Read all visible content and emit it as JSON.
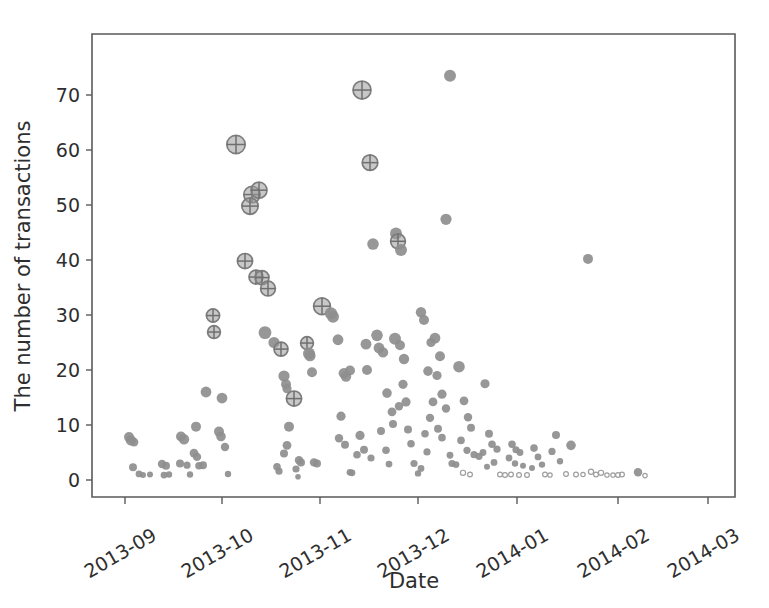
{
  "figure": {
    "background_color": "#ffffff",
    "marker_color": "#8e8e8e",
    "axis_color": "#5a5a5a"
  },
  "chart_data": {
    "type": "scatter",
    "title": "",
    "xlabel": "Date",
    "ylabel": "The number of transactions",
    "grid": false,
    "legend": null,
    "xlim": [
      "2013-08-20",
      "2014-03-05"
    ],
    "ylim": [
      -3,
      76
    ],
    "y_ticks": [
      0,
      10,
      20,
      30,
      40,
      50,
      60,
      70
    ],
    "y_tick_labels": [
      "0",
      "10",
      "20",
      "30",
      "40",
      "50",
      "60",
      "70"
    ],
    "x_ticks": [
      "2013-09",
      "2013-10",
      "2013-11",
      "2013-12",
      "2014-01",
      "2014-02",
      "2014-03"
    ],
    "x_tick_labels": [
      "2013-09",
      "2013-10",
      "2013-11",
      "2013-12",
      "2014-01",
      "2014-02",
      "2014-03"
    ],
    "x_tick_rotation_deg": -30,
    "marker_encoding": {
      "size_meaning": "marker radius scales with magnitude",
      "styles": [
        "solid-disc",
        "ring-with-crosshair",
        "small-hollow-circle"
      ]
    },
    "note": "Each point is one day; y is daily transaction count. Radius r is in plot pixels.",
    "points": [
      {
        "x": 129,
        "y": 7.8,
        "r": 5.0,
        "style": "solid"
      },
      {
        "x": 131,
        "y": 7.2,
        "r": 5.2,
        "style": "solid"
      },
      {
        "x": 134,
        "y": 6.9,
        "r": 4.4,
        "style": "solid"
      },
      {
        "x": 133,
        "y": 2.3,
        "r": 4.0,
        "style": "solid"
      },
      {
        "x": 139,
        "y": 1.1,
        "r": 3.4,
        "style": "solid"
      },
      {
        "x": 143,
        "y": 0.9,
        "r": 3.0,
        "style": "solid"
      },
      {
        "x": 150,
        "y": 1.0,
        "r": 3.0,
        "style": "solid"
      },
      {
        "x": 162,
        "y": 2.9,
        "r": 4.2,
        "style": "solid"
      },
      {
        "x": 166,
        "y": 2.6,
        "r": 4.0,
        "style": "solid"
      },
      {
        "x": 164,
        "y": 0.9,
        "r": 3.4,
        "style": "solid"
      },
      {
        "x": 169,
        "y": 1.0,
        "r": 3.2,
        "style": "solid"
      },
      {
        "x": 181,
        "y": 7.9,
        "r": 5.0,
        "style": "solid"
      },
      {
        "x": 184,
        "y": 7.4,
        "r": 5.2,
        "style": "solid"
      },
      {
        "x": 180,
        "y": 3.0,
        "r": 4.0,
        "style": "solid"
      },
      {
        "x": 187,
        "y": 2.7,
        "r": 3.6,
        "style": "solid"
      },
      {
        "x": 190,
        "y": 1.0,
        "r": 3.2,
        "style": "solid"
      },
      {
        "x": 196,
        "y": 9.7,
        "r": 5.0,
        "style": "solid"
      },
      {
        "x": 194,
        "y": 4.9,
        "r": 4.4,
        "style": "solid"
      },
      {
        "x": 197,
        "y": 4.2,
        "r": 4.2,
        "style": "solid"
      },
      {
        "x": 199,
        "y": 2.6,
        "r": 3.8,
        "style": "solid"
      },
      {
        "x": 203,
        "y": 2.7,
        "r": 4.0,
        "style": "solid"
      },
      {
        "x": 206,
        "y": 16.0,
        "r": 5.4,
        "style": "solid"
      },
      {
        "x": 213,
        "y": 29.9,
        "r": 6.6,
        "style": "ring"
      },
      {
        "x": 214,
        "y": 26.9,
        "r": 6.4,
        "style": "ring"
      },
      {
        "x": 222,
        "y": 14.9,
        "r": 5.4,
        "style": "solid"
      },
      {
        "x": 219,
        "y": 8.8,
        "r": 5.0,
        "style": "solid"
      },
      {
        "x": 221,
        "y": 7.9,
        "r": 4.8,
        "style": "solid"
      },
      {
        "x": 225,
        "y": 6.0,
        "r": 4.2,
        "style": "solid"
      },
      {
        "x": 228,
        "y": 1.1,
        "r": 3.2,
        "style": "solid"
      },
      {
        "x": 236,
        "y": 61.0,
        "r": 9.2,
        "style": "ring"
      },
      {
        "x": 245,
        "y": 39.8,
        "r": 7.6,
        "style": "ring"
      },
      {
        "x": 252,
        "y": 51.9,
        "r": 8.2,
        "style": "ring"
      },
      {
        "x": 250,
        "y": 49.8,
        "r": 8.2,
        "style": "ring"
      },
      {
        "x": 259,
        "y": 52.7,
        "r": 8.0,
        "style": "ring"
      },
      {
        "x": 256,
        "y": 36.9,
        "r": 7.0,
        "style": "ring"
      },
      {
        "x": 262,
        "y": 36.8,
        "r": 7.0,
        "style": "ring"
      },
      {
        "x": 268,
        "y": 34.8,
        "r": 7.4,
        "style": "ring"
      },
      {
        "x": 265,
        "y": 26.8,
        "r": 6.4,
        "style": "solid"
      },
      {
        "x": 274,
        "y": 25.0,
        "r": 5.6,
        "style": "solid"
      },
      {
        "x": 281,
        "y": 23.8,
        "r": 7.0,
        "style": "ring"
      },
      {
        "x": 284,
        "y": 18.9,
        "r": 5.6,
        "style": "solid"
      },
      {
        "x": 286,
        "y": 17.4,
        "r": 5.0,
        "style": "solid"
      },
      {
        "x": 287,
        "y": 16.6,
        "r": 4.6,
        "style": "solid"
      },
      {
        "x": 289,
        "y": 9.7,
        "r": 5.0,
        "style": "solid"
      },
      {
        "x": 287,
        "y": 6.3,
        "r": 4.4,
        "style": "solid"
      },
      {
        "x": 284,
        "y": 4.8,
        "r": 4.0,
        "style": "solid"
      },
      {
        "x": 279,
        "y": 1.6,
        "r": 3.6,
        "style": "solid"
      },
      {
        "x": 277,
        "y": 2.4,
        "r": 3.8,
        "style": "solid"
      },
      {
        "x": 294,
        "y": 14.8,
        "r": 7.6,
        "style": "ring"
      },
      {
        "x": 296,
        "y": 2.0,
        "r": 3.6,
        "style": "solid"
      },
      {
        "x": 299,
        "y": 3.6,
        "r": 4.2,
        "style": "solid"
      },
      {
        "x": 301,
        "y": 3.2,
        "r": 4.0,
        "style": "solid"
      },
      {
        "x": 298,
        "y": 0.6,
        "r": 2.8,
        "style": "solid"
      },
      {
        "x": 307,
        "y": 24.9,
        "r": 6.4,
        "style": "ring"
      },
      {
        "x": 309,
        "y": 23.0,
        "r": 6.0,
        "style": "solid"
      },
      {
        "x": 310,
        "y": 22.6,
        "r": 5.6,
        "style": "solid"
      },
      {
        "x": 312,
        "y": 19.6,
        "r": 5.0,
        "style": "solid"
      },
      {
        "x": 314,
        "y": 3.2,
        "r": 4.2,
        "style": "solid"
      },
      {
        "x": 317,
        "y": 3.0,
        "r": 4.0,
        "style": "solid"
      },
      {
        "x": 322,
        "y": 31.6,
        "r": 8.4,
        "style": "ring"
      },
      {
        "x": 331,
        "y": 30.3,
        "r": 6.2,
        "style": "solid"
      },
      {
        "x": 333,
        "y": 29.7,
        "r": 6.0,
        "style": "solid"
      },
      {
        "x": 338,
        "y": 25.5,
        "r": 5.4,
        "style": "solid"
      },
      {
        "x": 344,
        "y": 19.4,
        "r": 5.4,
        "style": "solid"
      },
      {
        "x": 346,
        "y": 18.8,
        "r": 5.2,
        "style": "solid"
      },
      {
        "x": 350,
        "y": 19.9,
        "r": 5.0,
        "style": "solid"
      },
      {
        "x": 341,
        "y": 11.6,
        "r": 4.6,
        "style": "solid"
      },
      {
        "x": 339,
        "y": 7.6,
        "r": 4.2,
        "style": "solid"
      },
      {
        "x": 345,
        "y": 6.4,
        "r": 4.0,
        "style": "solid"
      },
      {
        "x": 350,
        "y": 1.4,
        "r": 3.4,
        "style": "solid"
      },
      {
        "x": 352,
        "y": 1.3,
        "r": 3.4,
        "style": "solid"
      },
      {
        "x": 362,
        "y": 70.9,
        "r": 9.0,
        "style": "ring"
      },
      {
        "x": 370,
        "y": 57.7,
        "r": 7.8,
        "style": "ring"
      },
      {
        "x": 373,
        "y": 42.9,
        "r": 5.8,
        "style": "solid"
      },
      {
        "x": 377,
        "y": 26.3,
        "r": 5.8,
        "style": "solid"
      },
      {
        "x": 379,
        "y": 24.0,
        "r": 5.4,
        "style": "solid"
      },
      {
        "x": 366,
        "y": 24.7,
        "r": 5.4,
        "style": "solid"
      },
      {
        "x": 367,
        "y": 20.0,
        "r": 5.0,
        "style": "solid"
      },
      {
        "x": 360,
        "y": 8.1,
        "r": 4.6,
        "style": "solid"
      },
      {
        "x": 364,
        "y": 5.5,
        "r": 4.0,
        "style": "solid"
      },
      {
        "x": 357,
        "y": 4.6,
        "r": 3.8,
        "style": "solid"
      },
      {
        "x": 371,
        "y": 4.0,
        "r": 3.6,
        "style": "solid"
      },
      {
        "x": 383,
        "y": 23.2,
        "r": 5.2,
        "style": "solid"
      },
      {
        "x": 387,
        "y": 15.8,
        "r": 4.8,
        "style": "solid"
      },
      {
        "x": 392,
        "y": 12.4,
        "r": 4.4,
        "style": "solid"
      },
      {
        "x": 381,
        "y": 8.9,
        "r": 4.0,
        "style": "solid"
      },
      {
        "x": 386,
        "y": 5.4,
        "r": 3.8,
        "style": "solid"
      },
      {
        "x": 389,
        "y": 2.9,
        "r": 3.4,
        "style": "solid"
      },
      {
        "x": 396,
        "y": 44.8,
        "r": 6.0,
        "style": "solid"
      },
      {
        "x": 398,
        "y": 43.4,
        "r": 7.4,
        "style": "ring"
      },
      {
        "x": 401,
        "y": 41.8,
        "r": 6.0,
        "style": "solid"
      },
      {
        "x": 395,
        "y": 25.7,
        "r": 6.0,
        "style": "solid"
      },
      {
        "x": 400,
        "y": 24.5,
        "r": 5.0,
        "style": "solid"
      },
      {
        "x": 404,
        "y": 22.0,
        "r": 5.2,
        "style": "solid"
      },
      {
        "x": 403,
        "y": 17.4,
        "r": 4.6,
        "style": "solid"
      },
      {
        "x": 406,
        "y": 14.2,
        "r": 4.6,
        "style": "solid"
      },
      {
        "x": 399,
        "y": 13.4,
        "r": 4.2,
        "style": "solid"
      },
      {
        "x": 393,
        "y": 10.2,
        "r": 4.0,
        "style": "solid"
      },
      {
        "x": 408,
        "y": 9.2,
        "r": 4.0,
        "style": "solid"
      },
      {
        "x": 411,
        "y": 6.6,
        "r": 3.8,
        "style": "solid"
      },
      {
        "x": 414,
        "y": 3.0,
        "r": 3.6,
        "style": "solid"
      },
      {
        "x": 418,
        "y": 1.2,
        "r": 3.2,
        "style": "solid"
      },
      {
        "x": 421,
        "y": 30.5,
        "r": 5.2,
        "style": "solid"
      },
      {
        "x": 424,
        "y": 29.1,
        "r": 5.0,
        "style": "solid"
      },
      {
        "x": 450,
        "y": 73.5,
        "r": 6.0,
        "style": "solid"
      },
      {
        "x": 446,
        "y": 47.4,
        "r": 5.6,
        "style": "solid"
      },
      {
        "x": 435,
        "y": 25.8,
        "r": 5.4,
        "style": "solid"
      },
      {
        "x": 431,
        "y": 25.0,
        "r": 4.6,
        "style": "solid"
      },
      {
        "x": 440,
        "y": 22.5,
        "r": 5.0,
        "style": "solid"
      },
      {
        "x": 428,
        "y": 19.8,
        "r": 4.8,
        "style": "solid"
      },
      {
        "x": 437,
        "y": 19.0,
        "r": 4.6,
        "style": "solid"
      },
      {
        "x": 442,
        "y": 15.6,
        "r": 4.6,
        "style": "solid"
      },
      {
        "x": 433,
        "y": 14.2,
        "r": 4.4,
        "style": "solid"
      },
      {
        "x": 446,
        "y": 13.0,
        "r": 4.2,
        "style": "solid"
      },
      {
        "x": 430,
        "y": 11.3,
        "r": 4.2,
        "style": "solid"
      },
      {
        "x": 438,
        "y": 9.3,
        "r": 4.0,
        "style": "solid"
      },
      {
        "x": 425,
        "y": 8.4,
        "r": 3.8,
        "style": "solid"
      },
      {
        "x": 442,
        "y": 7.7,
        "r": 3.8,
        "style": "solid"
      },
      {
        "x": 427,
        "y": 5.1,
        "r": 3.6,
        "style": "solid"
      },
      {
        "x": 450,
        "y": 4.5,
        "r": 3.4,
        "style": "solid"
      },
      {
        "x": 452,
        "y": 3.0,
        "r": 3.6,
        "style": "solid"
      },
      {
        "x": 421,
        "y": 2.1,
        "r": 3.4,
        "style": "solid"
      },
      {
        "x": 459,
        "y": 20.6,
        "r": 5.8,
        "style": "solid"
      },
      {
        "x": 464,
        "y": 14.4,
        "r": 4.4,
        "style": "solid"
      },
      {
        "x": 468,
        "y": 11.4,
        "r": 4.2,
        "style": "solid"
      },
      {
        "x": 471,
        "y": 9.5,
        "r": 4.0,
        "style": "solid"
      },
      {
        "x": 461,
        "y": 7.2,
        "r": 3.8,
        "style": "solid"
      },
      {
        "x": 467,
        "y": 5.4,
        "r": 3.6,
        "style": "solid"
      },
      {
        "x": 474,
        "y": 4.6,
        "r": 3.6,
        "style": "solid"
      },
      {
        "x": 479,
        "y": 4.3,
        "r": 3.6,
        "style": "solid"
      },
      {
        "x": 456,
        "y": 2.8,
        "r": 3.4,
        "style": "solid"
      },
      {
        "x": 463,
        "y": 1.3,
        "r": 2.6,
        "style": "hollow"
      },
      {
        "x": 470,
        "y": 1.0,
        "r": 2.4,
        "style": "hollow"
      },
      {
        "x": 485,
        "y": 17.5,
        "r": 4.6,
        "style": "solid"
      },
      {
        "x": 489,
        "y": 8.4,
        "r": 4.0,
        "style": "solid"
      },
      {
        "x": 492,
        "y": 6.5,
        "r": 3.8,
        "style": "solid"
      },
      {
        "x": 497,
        "y": 5.6,
        "r": 3.6,
        "style": "solid"
      },
      {
        "x": 483,
        "y": 5.0,
        "r": 3.4,
        "style": "solid"
      },
      {
        "x": 494,
        "y": 3.2,
        "r": 3.4,
        "style": "solid"
      },
      {
        "x": 487,
        "y": 2.4,
        "r": 3.0,
        "style": "solid"
      },
      {
        "x": 500,
        "y": 1.0,
        "r": 2.4,
        "style": "hollow"
      },
      {
        "x": 505,
        "y": 0.9,
        "r": 2.4,
        "style": "hollow"
      },
      {
        "x": 512,
        "y": 6.5,
        "r": 3.8,
        "style": "solid"
      },
      {
        "x": 516,
        "y": 5.5,
        "r": 3.6,
        "style": "solid"
      },
      {
        "x": 520,
        "y": 5.0,
        "r": 3.4,
        "style": "solid"
      },
      {
        "x": 509,
        "y": 4.0,
        "r": 3.4,
        "style": "solid"
      },
      {
        "x": 515,
        "y": 3.0,
        "r": 3.2,
        "style": "solid"
      },
      {
        "x": 523,
        "y": 2.6,
        "r": 3.0,
        "style": "solid"
      },
      {
        "x": 511,
        "y": 1.0,
        "r": 2.4,
        "style": "hollow"
      },
      {
        "x": 519,
        "y": 0.9,
        "r": 2.4,
        "style": "hollow"
      },
      {
        "x": 527,
        "y": 0.9,
        "r": 2.4,
        "style": "hollow"
      },
      {
        "x": 534,
        "y": 5.8,
        "r": 3.8,
        "style": "solid"
      },
      {
        "x": 538,
        "y": 4.2,
        "r": 3.4,
        "style": "solid"
      },
      {
        "x": 542,
        "y": 2.8,
        "r": 3.2,
        "style": "solid"
      },
      {
        "x": 532,
        "y": 2.2,
        "r": 3.0,
        "style": "solid"
      },
      {
        "x": 545,
        "y": 1.0,
        "r": 2.4,
        "style": "hollow"
      },
      {
        "x": 550,
        "y": 0.9,
        "r": 2.2,
        "style": "hollow"
      },
      {
        "x": 556,
        "y": 8.2,
        "r": 4.0,
        "style": "solid"
      },
      {
        "x": 552,
        "y": 5.2,
        "r": 3.6,
        "style": "solid"
      },
      {
        "x": 560,
        "y": 3.4,
        "r": 3.2,
        "style": "solid"
      },
      {
        "x": 566,
        "y": 1.1,
        "r": 2.4,
        "style": "hollow"
      },
      {
        "x": 571,
        "y": 6.3,
        "r": 4.8,
        "style": "solid"
      },
      {
        "x": 576,
        "y": 1.0,
        "r": 2.4,
        "style": "hollow"
      },
      {
        "x": 583,
        "y": 1.0,
        "r": 2.2,
        "style": "hollow"
      },
      {
        "x": 591,
        "y": 1.5,
        "r": 2.6,
        "style": "hollow"
      },
      {
        "x": 596,
        "y": 1.0,
        "r": 2.4,
        "style": "hollow"
      },
      {
        "x": 601,
        "y": 1.3,
        "r": 2.6,
        "style": "hollow"
      },
      {
        "x": 607,
        "y": 0.9,
        "r": 2.2,
        "style": "hollow"
      },
      {
        "x": 613,
        "y": 0.9,
        "r": 2.2,
        "style": "hollow"
      },
      {
        "x": 618,
        "y": 0.9,
        "r": 2.4,
        "style": "hollow"
      },
      {
        "x": 622,
        "y": 1.0,
        "r": 2.4,
        "style": "hollow"
      },
      {
        "x": 588,
        "y": 40.2,
        "r": 5.0,
        "style": "solid"
      },
      {
        "x": 638,
        "y": 1.4,
        "r": 4.2,
        "style": "solid"
      },
      {
        "x": 645,
        "y": 0.8,
        "r": 2.2,
        "style": "hollow"
      }
    ]
  },
  "axes_geometry": {
    "plot_left_px": 92,
    "plot_right_px": 735,
    "plot_top_px": 34,
    "plot_bottom_px": 497,
    "y_zero_px": 480,
    "y_per_unit_px": 5.5,
    "x_tick_px": [
      125,
      222,
      320,
      418,
      517,
      618,
      708
    ]
  }
}
